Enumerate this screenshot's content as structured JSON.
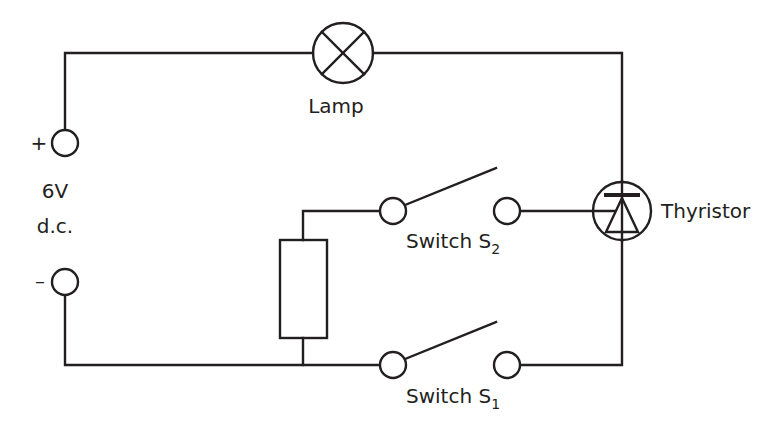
{
  "diagram": {
    "type": "circuit",
    "stroke_color": "#231f20",
    "background": "#ffffff",
    "labels": {
      "lamp": "Lamp",
      "thyristor": "Thyristor",
      "supply_voltage": "6V",
      "supply_type": "d.c.",
      "positive": "+",
      "negative": "–",
      "switch2_text": "Switch S",
      "switch2_sub": "2",
      "switch1_text": "Switch S",
      "switch1_sub": "1"
    },
    "components": [
      {
        "id": "supply",
        "kind": "dc-supply",
        "label": "6V d.c."
      },
      {
        "id": "lamp",
        "kind": "lamp",
        "label": "Lamp"
      },
      {
        "id": "thyristor",
        "kind": "thyristor",
        "label": "Thyristor"
      },
      {
        "id": "resistor",
        "kind": "resistor",
        "label": ""
      },
      {
        "id": "s2",
        "kind": "switch-open",
        "label": "Switch S2"
      },
      {
        "id": "s1",
        "kind": "switch-open",
        "label": "Switch S1"
      }
    ]
  }
}
